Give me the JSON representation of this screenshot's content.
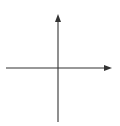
{
  "chart_data": {
    "type": "line",
    "title": "",
    "xlabel": "x",
    "ylabel": "y",
    "xlim": [
      -5,
      5
    ],
    "ylim": [
      -5,
      5.5
    ],
    "grid": true,
    "grid_step": 1,
    "x_ticks": [
      {
        "value": -2,
        "label": "-2"
      },
      {
        "value": 2,
        "label": "2"
      }
    ],
    "y_ticks": [
      {
        "value": 2,
        "label": "2"
      },
      {
        "value": -2,
        "label": "-2"
      }
    ],
    "series": [
      {
        "name": "line",
        "equation": "y = -0.4x + 0.6",
        "x": [
          -5,
          5
        ],
        "y": [
          2.6,
          -1.4
        ],
        "color": "#6a6a6a"
      }
    ],
    "legend": null
  },
  "labels": {
    "x_axis": "x",
    "y_axis": "y",
    "x_tick_neg2": "-2",
    "x_tick_pos2": "2",
    "y_tick_pos2": "2",
    "y_tick_neg2": "-2"
  }
}
